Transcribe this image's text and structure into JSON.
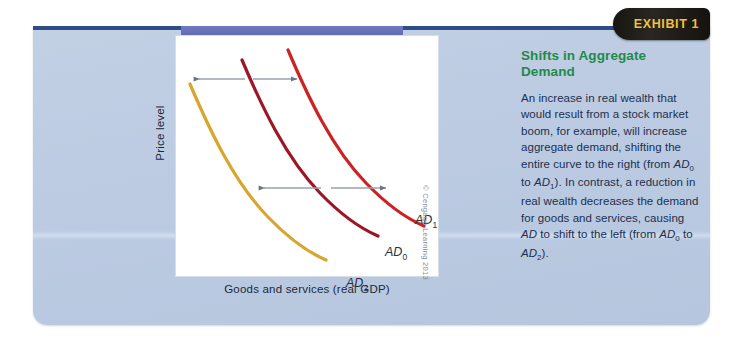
{
  "exhibit": {
    "tab_label": "EXHIBIT 1",
    "tab_bg": "#17150f",
    "tab_text_color": "#f0c23a",
    "panel_bg": "#bccbe2",
    "top_rule_color": "#2e4d86"
  },
  "caption": {
    "heading": "Shifts in Aggregate Demand",
    "heading_color": "#1f8a4c",
    "body_text": "An increase in real wealth that would result from a stock market boom, for example, will increase aggregate demand, shifting the entire curve to the right (from AD0 to AD1). In contrast, a reduction in real wealth decreases the demand for goods and services, causing AD to shift to the left (from AD0 to AD2).",
    "body_color": "#20304f"
  },
  "chart_data": {
    "type": "line",
    "title": "Shifts in Aggregate Demand",
    "xlabel": "Goods and services (real GDP)",
    "ylabel": "Price level",
    "xlim": [
      0,
      100
    ],
    "ylim": [
      0,
      100
    ],
    "grid": false,
    "legend": "inline-curve-labels",
    "credit": "© Cengage Learning 2013",
    "series": [
      {
        "name": "AD1",
        "label": "AD",
        "subscript": "1",
        "color": "#cc2222",
        "description": "rightmost aggregate demand curve, downward sloping convex",
        "points": [
          [
            30,
            97
          ],
          [
            38,
            78
          ],
          [
            50,
            58
          ],
          [
            66,
            40
          ],
          [
            84,
            28
          ],
          [
            97,
            23
          ]
        ]
      },
      {
        "name": "AD0",
        "label": "AD",
        "subscript": "0",
        "color": "#9c1625",
        "description": "middle aggregate demand curve, downward sloping convex",
        "points": [
          [
            18,
            90
          ],
          [
            26,
            71
          ],
          [
            38,
            51
          ],
          [
            54,
            33
          ],
          [
            72,
            21
          ],
          [
            85,
            15
          ]
        ]
      },
      {
        "name": "AD2",
        "label": "AD",
        "subscript": "2",
        "color": "#d8a62e",
        "description": "leftmost aggregate demand curve, downward sloping convex",
        "points": [
          [
            5,
            80
          ],
          [
            13,
            61
          ],
          [
            25,
            41
          ],
          [
            41,
            23
          ],
          [
            59,
            11
          ],
          [
            72,
            6
          ]
        ]
      }
    ],
    "annotations": [
      {
        "name": "shift-left-arrow-top",
        "direction": "left",
        "from": "AD0",
        "to": "AD2",
        "y": 82
      },
      {
        "name": "shift-right-arrow-top",
        "direction": "right",
        "from": "AD0",
        "to": "AD1",
        "y": 82
      },
      {
        "name": "shift-left-arrow-mid",
        "direction": "left",
        "from": "AD0",
        "to": "AD2",
        "y": 33
      },
      {
        "name": "shift-right-arrow-mid",
        "direction": "right",
        "from": "AD0",
        "to": "AD1",
        "y": 33
      }
    ]
  }
}
